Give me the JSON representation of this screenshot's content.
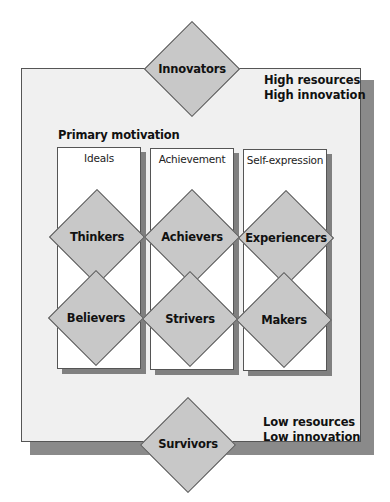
{
  "diagram": {
    "top_segment": "Innovators",
    "bottom_segment": "Survivors",
    "top_right_label": [
      "High resources",
      "High innovation"
    ],
    "bottom_right_label": [
      "Low resources",
      "Low innovation"
    ],
    "motivation_heading": "Primary motivation",
    "columns": [
      {
        "label": "Ideals",
        "high": "Thinkers",
        "low": "Believers"
      },
      {
        "label": "Achievement",
        "high": "Achievers",
        "low": "Strivers"
      },
      {
        "label": "Self-expression",
        "high": "Experiencers",
        "low": "Makers"
      }
    ],
    "colors": {
      "panel": "#f0f0f0",
      "shadow": "#8a8a8a",
      "diamond": "#c8c8c8",
      "column": "#ffffff",
      "border": "#555555"
    }
  }
}
